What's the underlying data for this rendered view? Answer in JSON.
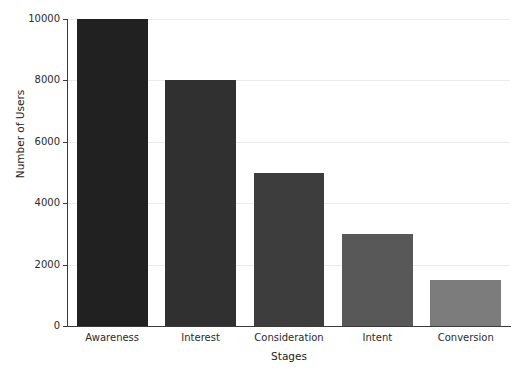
{
  "chart_data": {
    "type": "bar",
    "title": "",
    "subtitle": "",
    "xlabel": "Stages",
    "ylabel": "Number of Users",
    "categories": [
      "Awareness",
      "Interest",
      "Consideration",
      "Intent",
      "Conversion"
    ],
    "values": [
      10000,
      8000,
      5000,
      3000,
      1500
    ],
    "bar_colors": [
      "#212121",
      "#303030",
      "#3d3d3d",
      "#585858",
      "#7c7c7c"
    ],
    "ylim": [
      0,
      10000
    ],
    "yticks": [
      0,
      2000,
      4000,
      6000,
      8000,
      10000
    ],
    "ytick_labels": [
      "0",
      "2000",
      "4000",
      "6000",
      "8000",
      "10000"
    ],
    "grid": true,
    "grid_axis": "y",
    "grid_color": "#ebebeb",
    "legend": null,
    "legend_position": "none",
    "annotations": [],
    "background_color": "#ffffff",
    "axis_color": "#3a3a3a",
    "series": [
      {
        "name": "Number of Users",
        "values": [
          10000,
          8000,
          5000,
          3000,
          1500
        ]
      }
    ]
  }
}
